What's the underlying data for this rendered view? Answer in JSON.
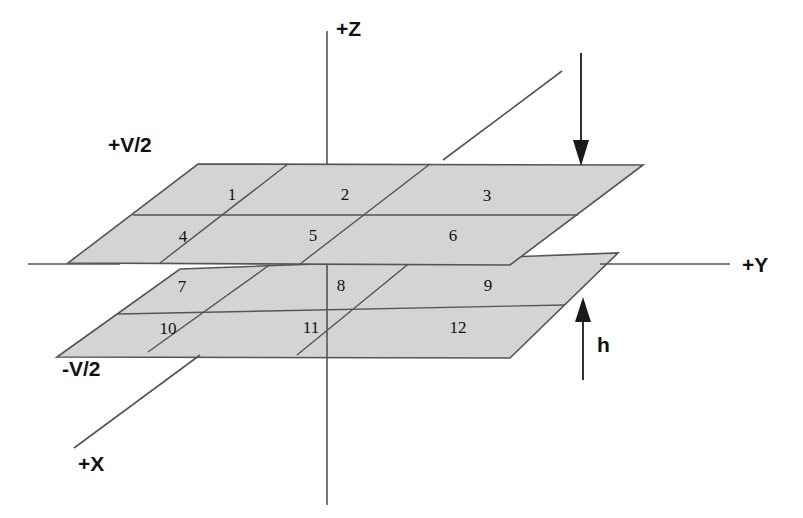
{
  "figure": {
    "type": "technical-diagram"
  },
  "axes": [
    {
      "name": "z-axis",
      "label": "+Z",
      "label_x": 336,
      "label_y": 36
    },
    {
      "name": "y-axis",
      "label": "+Y",
      "label_x": 742,
      "label_y": 272
    },
    {
      "name": "x-axis",
      "label": "+X",
      "label_x": 78,
      "label_y": 471
    }
  ],
  "plates": [
    {
      "name": "upper-plate",
      "potential_label": "+V/2",
      "label_x": 108,
      "label_y": 152,
      "cells": [
        {
          "id": "1",
          "x": 232,
          "y": 200
        },
        {
          "id": "2",
          "x": 345,
          "y": 200
        },
        {
          "id": "3",
          "x": 487,
          "y": 201
        },
        {
          "id": "4",
          "x": 183,
          "y": 242
        },
        {
          "id": "5",
          "x": 313,
          "y": 241
        },
        {
          "id": "6",
          "x": 453,
          "y": 241
        }
      ]
    },
    {
      "name": "lower-plate",
      "potential_label": "-V/2",
      "label_x": 62,
      "label_y": 376,
      "cells": [
        {
          "id": "7",
          "x": 182,
          "y": 292
        },
        {
          "id": "8",
          "x": 341,
          "y": 291
        },
        {
          "id": "9",
          "x": 488,
          "y": 291
        },
        {
          "id": "10",
          "x": 168,
          "y": 334
        },
        {
          "id": "11",
          "x": 311,
          "y": 333
        },
        {
          "id": "12",
          "x": 458,
          "y": 333
        }
      ]
    }
  ],
  "annotations": [
    {
      "name": "downward-field-arrow",
      "label": "",
      "direction": "down"
    },
    {
      "name": "separation-arrow",
      "label": "h",
      "label_x": 597,
      "label_y": 352,
      "direction": "up"
    }
  ],
  "colors": {
    "plate_fill": "#d4d4d4",
    "plate_stroke": "#555555",
    "axis_stroke": "#555555",
    "annotation_stroke": "#1a1a1a",
    "text": "#111111",
    "background": "#ffffff"
  }
}
